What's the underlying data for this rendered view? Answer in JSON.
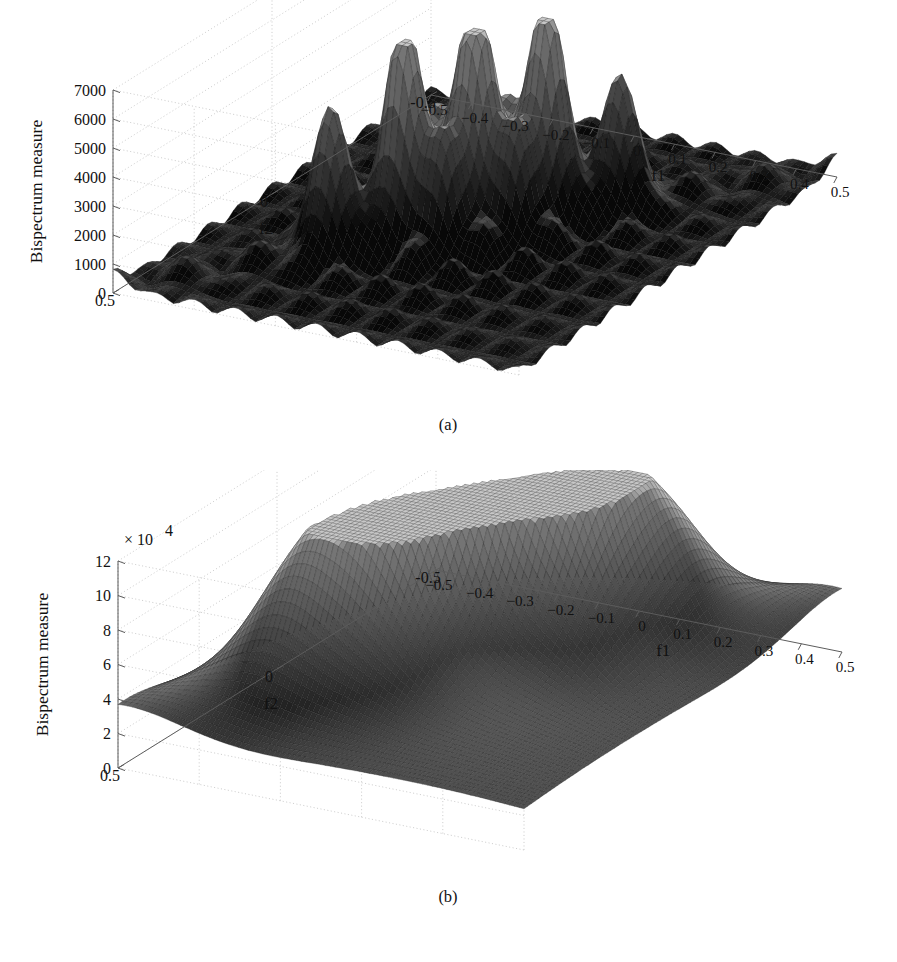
{
  "figure": {
    "background": "#ffffff",
    "panels": [
      {
        "id": "a",
        "caption": "(a)",
        "ylabel": "Bispectrum measure",
        "xlabel": "f1",
        "zlabel": "f2",
        "exponent": "",
        "y_ticks": [
          "0",
          "1000",
          "2000",
          "3000",
          "4000",
          "5000",
          "6000",
          "7000"
        ],
        "x_ticks": [
          "-0.5",
          "-0.4",
          "-0.3",
          "-0.2",
          "-0.1",
          "0",
          "0.1",
          "0.2",
          "0.3",
          "0.4",
          "0.5"
        ],
        "z_ticks": [
          "0.5",
          "0",
          "-0.5"
        ]
      },
      {
        "id": "b",
        "caption": "(b)",
        "ylabel": "Bispectrum measure",
        "xlabel": "f1",
        "zlabel": "f2",
        "exponent": "× 10",
        "exponent_sup": "4",
        "y_ticks": [
          "0",
          "2",
          "4",
          "6",
          "8",
          "10",
          "12"
        ],
        "x_ticks": [
          "-0.5",
          "-0.4",
          "-0.3",
          "-0.2",
          "-0.1",
          "0",
          "0.1",
          "0.2",
          "0.3",
          "0.4",
          "0.5"
        ],
        "z_ticks": [
          "0.5",
          "0",
          "-0.5"
        ]
      }
    ]
  },
  "chart_data": [
    {
      "type": "surface",
      "panel": "a",
      "title": "",
      "xlabel": "f1",
      "ylabel": "f2",
      "zlabel": "Bispectrum measure",
      "xlim": [
        -0.5,
        0.5
      ],
      "ylim": [
        -0.5,
        0.5
      ],
      "zlim": [
        0,
        7000
      ],
      "xticks": [
        -0.5,
        -0.4,
        -0.3,
        -0.2,
        -0.1,
        0,
        0.1,
        0.2,
        0.3,
        0.4,
        0.5
      ],
      "yticks": [
        0.5,
        0,
        -0.5
      ],
      "zticks": [
        0,
        1000,
        2000,
        3000,
        4000,
        5000,
        6000,
        7000
      ],
      "grid": true,
      "legend": "none",
      "colormap": "gray",
      "description": "Regular lattice of sharp narrow bispectrum peaks; three tall central peaks with flanking medium peaks on a bed of many small side-lobe bumps.",
      "peaks": [
        {
          "x": -0.1,
          "y": 0.1,
          "height": 6300,
          "width": 0.042
        },
        {
          "x": 0.0,
          "y": 0.0,
          "height": 6400,
          "width": 0.042
        },
        {
          "x": 0.1,
          "y": -0.1,
          "height": 6300,
          "width": 0.042
        },
        {
          "x": -0.2,
          "y": 0.2,
          "height": 4050,
          "width": 0.044
        },
        {
          "x": 0.2,
          "y": -0.2,
          "height": 3550,
          "width": 0.044
        },
        {
          "x": -0.1,
          "y": 0.0,
          "height": 2600,
          "width": 0.042
        },
        {
          "x": 0.0,
          "y": 0.1,
          "height": 2600,
          "width": 0.042
        },
        {
          "x": 0.0,
          "y": -0.1,
          "height": 2500,
          "width": 0.042
        },
        {
          "x": 0.1,
          "y": 0.0,
          "height": 2500,
          "width": 0.042
        }
      ],
      "lattice_spacing": 0.1,
      "background_bump_height": 950,
      "peak_count_visible": 5
    },
    {
      "type": "surface",
      "panel": "b",
      "title": "",
      "xlabel": "f1",
      "ylabel": "f2",
      "zlabel": "Bispectrum measure",
      "xlim": [
        -0.5,
        0.5
      ],
      "ylim": [
        -0.5,
        0.5
      ],
      "zlim": [
        0,
        120000
      ],
      "z_scale_factor": 10000,
      "xticks": [
        -0.5,
        -0.4,
        -0.3,
        -0.2,
        -0.1,
        0,
        0.1,
        0.2,
        0.3,
        0.4,
        0.5
      ],
      "yticks": [
        0.5,
        0,
        -0.5
      ],
      "zticks": [
        0,
        20000,
        40000,
        60000,
        80000,
        100000,
        120000
      ],
      "grid": true,
      "legend": "none",
      "colormap": "gray",
      "description": "Three broad smooth dominant bispectrum peaks reaching about 11.3e4, joined by wide shoulders and a raised skirt spreading across the f1-f2 plane.",
      "peaks": [
        {
          "x": -0.11,
          "y": 0.11,
          "height": 113000,
          "width": 0.085
        },
        {
          "x": 0.0,
          "y": 0.0,
          "height": 113500,
          "width": 0.085
        },
        {
          "x": 0.11,
          "y": -0.11,
          "height": 112000,
          "width": 0.085
        },
        {
          "x": -0.24,
          "y": 0.24,
          "height": 52000,
          "width": 0.105
        },
        {
          "x": 0.24,
          "y": -0.24,
          "height": 50000,
          "width": 0.105
        },
        {
          "x": -0.05,
          "y": 0.2,
          "height": 40000,
          "width": 0.12
        },
        {
          "x": 0.2,
          "y": -0.05,
          "height": 38000,
          "width": 0.12
        }
      ],
      "background_bump_height": 18000,
      "peak_count_visible": 3
    }
  ]
}
